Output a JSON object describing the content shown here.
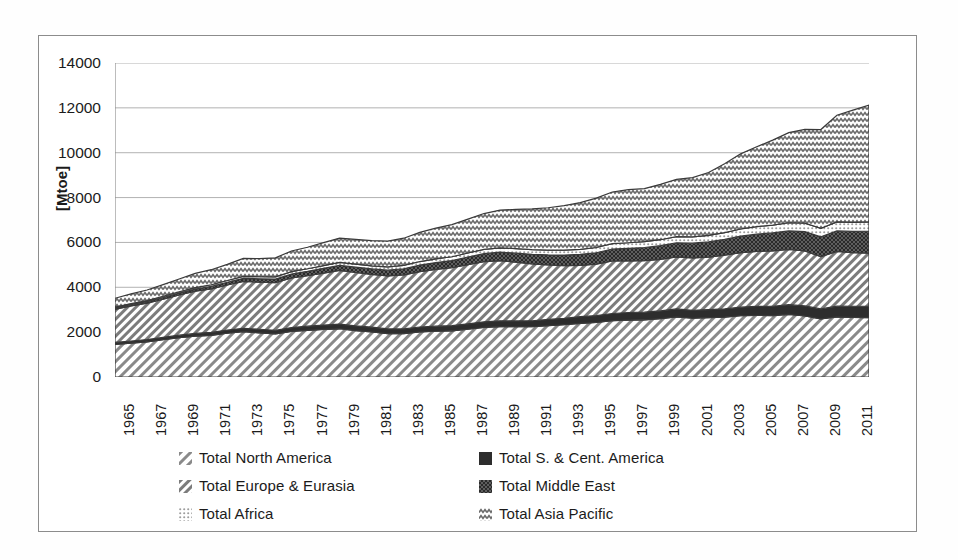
{
  "scan_artifact": {
    "line1": "",
    "line2": ""
  },
  "axes": {
    "y_label": "[Mtoe]",
    "y_ticks": [
      "14000",
      "12000",
      "10000",
      "8000",
      "6000",
      "4000",
      "2000",
      "0"
    ],
    "x_ticks": [
      "1965",
      "1967",
      "1969",
      "1971",
      "1973",
      "1975",
      "1977",
      "1979",
      "1981",
      "1983",
      "1985",
      "1987",
      "1989",
      "1991",
      "1993",
      "1995",
      "1997",
      "1999",
      "2001",
      "2003",
      "2005",
      "2007",
      "2009",
      "2011"
    ]
  },
  "legend": {
    "items": [
      {
        "label": "Total North America",
        "pattern": "diagonal-sparse",
        "color": "#6e6e6e"
      },
      {
        "label": "Total S. & Cent. America",
        "pattern": "solid-dark",
        "color": "#2a2a2a"
      },
      {
        "label": "Total Europe & Eurasia",
        "pattern": "diagonal-dense",
        "color": "#707070"
      },
      {
        "label": "Total Middle East",
        "pattern": "checker-dark",
        "color": "#262626"
      },
      {
        "label": "Total Africa",
        "pattern": "dotted",
        "color": "#9a9a9a"
      },
      {
        "label": "Total Asia Pacific",
        "pattern": "zigzag",
        "color": "#5f5f5f"
      }
    ]
  },
  "chart_data": {
    "type": "area",
    "stacked": true,
    "title": "",
    "xlabel": "",
    "ylabel": "[Mtoe]",
    "xlim": [
      1965,
      2012
    ],
    "ylim": [
      0,
      14000
    ],
    "ytick_step": 2000,
    "grid": "horizontal",
    "legend_position": "bottom",
    "x": [
      1965,
      1966,
      1967,
      1968,
      1969,
      1970,
      1971,
      1972,
      1973,
      1974,
      1975,
      1976,
      1977,
      1978,
      1979,
      1980,
      1981,
      1982,
      1983,
      1984,
      1985,
      1986,
      1987,
      1988,
      1989,
      1990,
      1991,
      1992,
      1993,
      1994,
      1995,
      1996,
      1997,
      1998,
      1999,
      2000,
      2001,
      2002,
      2003,
      2004,
      2005,
      2006,
      2007,
      2008,
      2009,
      2010,
      2011,
      2012
    ],
    "series": [
      {
        "name": "Total North America",
        "pattern": "diagonal-sparse",
        "values": [
          1450,
          1510,
          1570,
          1660,
          1750,
          1820,
          1860,
          1950,
          2020,
          1970,
          1920,
          2030,
          2080,
          2120,
          2150,
          2070,
          2010,
          1930,
          1930,
          2010,
          2040,
          2060,
          2130,
          2210,
          2250,
          2240,
          2240,
          2290,
          2330,
          2390,
          2430,
          2510,
          2540,
          2550,
          2600,
          2680,
          2620,
          2650,
          2670,
          2730,
          2750,
          2740,
          2790,
          2720,
          2590,
          2680,
          2660,
          2650
        ]
      },
      {
        "name": "Total S. & Cent. America",
        "pattern": "solid-dark",
        "values": [
          90,
          95,
          100,
          108,
          115,
          125,
          132,
          142,
          152,
          160,
          165,
          175,
          185,
          195,
          205,
          210,
          212,
          215,
          215,
          220,
          225,
          230,
          240,
          250,
          255,
          260,
          268,
          278,
          288,
          298,
          310,
          322,
          335,
          340,
          345,
          355,
          355,
          358,
          365,
          385,
          400,
          415,
          435,
          450,
          445,
          480,
          495,
          505
        ]
      },
      {
        "name": "Total Europe & Eurasia",
        "pattern": "diagonal-dense",
        "values": [
          1480,
          1560,
          1620,
          1700,
          1790,
          1880,
          1940,
          2010,
          2090,
          2100,
          2120,
          2210,
          2250,
          2320,
          2400,
          2380,
          2350,
          2360,
          2410,
          2470,
          2530,
          2580,
          2640,
          2680,
          2680,
          2620,
          2540,
          2430,
          2350,
          2290,
          2290,
          2340,
          2300,
          2300,
          2300,
          2320,
          2340,
          2340,
          2400,
          2430,
          2450,
          2470,
          2460,
          2450,
          2330,
          2440,
          2390,
          2370
        ]
      },
      {
        "name": "Total Middle East",
        "pattern": "checker-dark",
        "values": [
          55,
          60,
          68,
          75,
          85,
          95,
          108,
          122,
          138,
          148,
          160,
          178,
          196,
          212,
          228,
          238,
          246,
          258,
          272,
          290,
          305,
          320,
          340,
          360,
          380,
          400,
          420,
          445,
          470,
          490,
          510,
          535,
          560,
          585,
          610,
          630,
          650,
          675,
          700,
          735,
          770,
          800,
          830,
          865,
          885,
          915,
          945,
          975
        ]
      },
      {
        "name": "Total Africa",
        "pattern": "dotted",
        "values": [
          45,
          48,
          52,
          56,
          62,
          68,
          74,
          80,
          88,
          92,
          98,
          106,
          114,
          122,
          130,
          136,
          140,
          146,
          152,
          158,
          166,
          172,
          180,
          188,
          196,
          202,
          208,
          214,
          220,
          226,
          234,
          242,
          250,
          258,
          266,
          276,
          284,
          294,
          306,
          320,
          334,
          348,
          362,
          375,
          382,
          398,
          408,
          418
        ]
      },
      {
        "name": "Total Asia Pacific",
        "pattern": "zigzag",
        "values": [
          390,
          430,
          470,
          520,
          570,
          630,
          670,
          720,
          800,
          810,
          850,
          920,
          960,
          1020,
          1080,
          1100,
          1120,
          1150,
          1210,
          1300,
          1370,
          1430,
          1510,
          1600,
          1680,
          1750,
          1820,
          1890,
          1980,
          2080,
          2200,
          2300,
          2370,
          2370,
          2470,
          2550,
          2640,
          2800,
          3070,
          3350,
          3560,
          3790,
          4020,
          4180,
          4400,
          4760,
          5000,
          5200
        ]
      }
    ],
    "totals_note": "Stacked total rises from ~3500 Mtoe (1965) to ~12400 Mtoe (2012)"
  }
}
